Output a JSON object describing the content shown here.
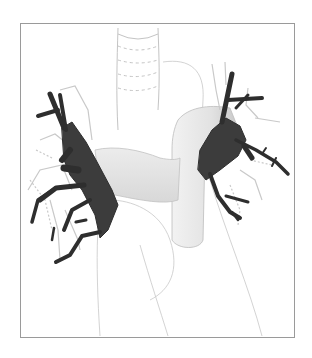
{
  "illustration": {
    "subject": "Anatomical sketch of heart with pulmonary veins highlighted",
    "colors": {
      "background": "#ffffff",
      "frame_border": "#9a9a9a",
      "vein_fill": "#3c3c3c",
      "sketch_line": "#b8b8b8",
      "vessel_shade": "#e6e6e6"
    },
    "frame": {
      "x": 20,
      "y": 23,
      "width": 275,
      "height": 315
    }
  }
}
